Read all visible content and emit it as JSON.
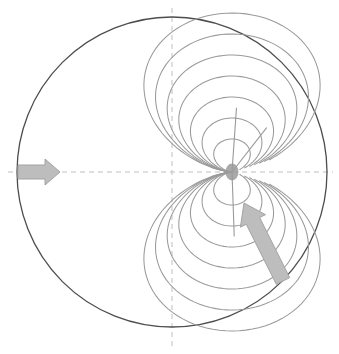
{
  "figure": {
    "title": "",
    "type": "magnetic-dipole-field-diagram",
    "background_color": "#ffffff",
    "width": 339,
    "height": 354
  },
  "colors": {
    "boundary_circle": "#4d4d4d",
    "field_line": "#9a9a9a",
    "radial_line": "#9a9a9a",
    "axis_dashed": "#bfbfbf",
    "arrow_fill": "#bdbdbd",
    "arrow_stroke": "#a3a3a3",
    "focus_point": "#9a9a9a"
  },
  "boundary": {
    "name": "boundary-circle",
    "center_x": 172,
    "center_y": 172,
    "radius": 155,
    "stroke_width": 1.3
  },
  "axes": {
    "horizontal": {
      "name": "horizontal-axis",
      "y": 172,
      "x_start": 8,
      "x_end": 333,
      "dash": "5 4"
    },
    "vertical": {
      "name": "vertical-axis",
      "x": 172,
      "y_start": 8,
      "y_end": 348,
      "dash": "5 4"
    }
  },
  "focus": {
    "name": "convergence-point",
    "x": 232,
    "y": 172,
    "rx": 6.5,
    "ry": 8.5
  },
  "arrows": [
    {
      "name": "inflow-arrow-left",
      "label": "",
      "direction": "right",
      "tail_x": 18,
      "tail_y": 172,
      "tip_x": 60,
      "tip_y": 172,
      "shaft_half_width": 7,
      "head_half_width": 13,
      "head_length": 15
    },
    {
      "name": "inflow-arrow-lower-right",
      "label": "",
      "direction": "up-left",
      "tail_x": 283,
      "tail_y": 281,
      "tip_x": 244,
      "tip_y": 203,
      "shaft_half_width": 7.5,
      "head_half_width": 14,
      "head_length": 20
    }
  ],
  "chart_data": {
    "type": "line",
    "title": "",
    "xlabel": "",
    "ylabel": "",
    "legend": [],
    "series": [
      {
        "name": "field-line-upper-1",
        "closure_scale": 0.22
      },
      {
        "name": "field-line-upper-2",
        "closure_scale": 0.36
      },
      {
        "name": "field-line-upper-3",
        "closure_scale": 0.5
      },
      {
        "name": "field-line-upper-4",
        "closure_scale": 0.64
      },
      {
        "name": "field-line-upper-5",
        "closure_scale": 0.78
      },
      {
        "name": "field-line-upper-6",
        "closure_scale": 0.92
      },
      {
        "name": "field-line-upper-7",
        "closure_scale": 1.06
      },
      {
        "name": "field-line-lower-1",
        "closure_scale": 0.22
      },
      {
        "name": "field-line-lower-2",
        "closure_scale": 0.36
      },
      {
        "name": "field-line-lower-3",
        "closure_scale": 0.5
      },
      {
        "name": "field-line-lower-4",
        "closure_scale": 0.64
      },
      {
        "name": "field-line-lower-5",
        "closure_scale": 0.78
      },
      {
        "name": "field-line-lower-6",
        "closure_scale": 0.92
      },
      {
        "name": "field-line-lower-7",
        "closure_scale": 1.06
      }
    ],
    "radial_lines": [
      {
        "name": "radial-line-vertical-up",
        "angle_deg": 86,
        "length": 64
      },
      {
        "name": "radial-line-diagonal-up-right",
        "angle_deg": 52,
        "length": 56
      },
      {
        "name": "radial-line-vertical-down",
        "angle_deg": -88,
        "length": 64
      }
    ]
  }
}
